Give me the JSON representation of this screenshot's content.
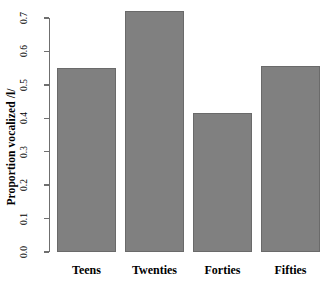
{
  "chart_data": {
    "type": "bar",
    "title": "",
    "subtitle": "",
    "xlabel": "",
    "ylabel": "Proportion vocalized /l/",
    "categories": [
      "Teens",
      "Twenties",
      "Forties",
      "Fifties"
    ],
    "values": [
      0.55,
      0.72,
      0.415,
      0.555
    ],
    "series": [
      {
        "name": "Proportion vocalized /l/",
        "values": [
          0.55,
          0.72,
          0.415,
          0.555
        ]
      }
    ],
    "ylim": [
      0,
      0.73
    ],
    "yticks": [
      0.0,
      0.1,
      0.2,
      0.3,
      0.4,
      0.5,
      0.6,
      0.7
    ],
    "ytick_labels": [
      "0.0",
      "0.1",
      "0.2",
      "0.3",
      "0.4",
      "0.5",
      "0.6",
      "0.7"
    ],
    "grid": false,
    "legend": false,
    "legend_position": "none",
    "bar_color": "#808080",
    "bar_border_color": "#6a6a6a",
    "axis_color": "#6f6f6f",
    "background_color": "#ffffff",
    "annotations": []
  },
  "axis": {
    "y_label": "Proportion vocalized /l/",
    "y_tick_labels": [
      "0.0",
      "0.1",
      "0.2",
      "0.3",
      "0.4",
      "0.5",
      "0.6",
      "0.7"
    ]
  },
  "bars": [
    {
      "label": "Teens",
      "value": 0.55
    },
    {
      "label": "Twenties",
      "value": 0.72
    },
    {
      "label": "Forties",
      "value": 0.415
    },
    {
      "label": "Fifties",
      "value": 0.555
    }
  ]
}
